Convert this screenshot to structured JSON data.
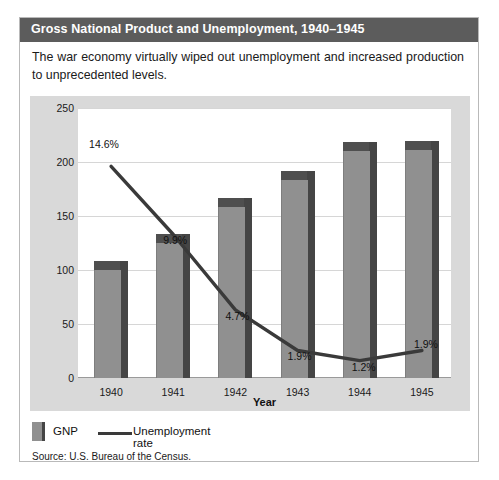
{
  "figure": {
    "title": "Gross National Product and Unemployment, 1940–1945",
    "caption": "The war economy virtually wiped out unemployment and increased production to unprecedented levels.",
    "source": "Source: U.S. Bureau of the Census."
  },
  "legend": {
    "gnp_label": "GNP",
    "unemployment_label": "Unemployment rate"
  },
  "colors": {
    "title_bar": "#5c5c5c",
    "panel_bg": "#d9d9d9",
    "plot_bg": "#ffffff",
    "bar_face": "#909090",
    "bar_shadow": "#454545",
    "line": "#3a3a3a",
    "grid": "#d6d6d6"
  },
  "chart_data": {
    "type": "bar",
    "title": "Gross National Product and Unemployment, 1940–1945",
    "xlabel": "Year",
    "ylabel": "GNP (in billions of dollars)",
    "categories": [
      "1940",
      "1941",
      "1942",
      "1943",
      "1944",
      "1945"
    ],
    "ylim": [
      0,
      250
    ],
    "yticks": [
      250,
      200,
      150,
      100,
      50,
      0
    ],
    "grid": true,
    "legend_position": "below-left",
    "series": [
      {
        "name": "GNP",
        "type": "bar",
        "unit": "billions of dollars",
        "values": [
          100,
          125,
          158,
          183,
          210,
          211
        ]
      },
      {
        "name": "Unemployment rate",
        "type": "line",
        "unit": "percent",
        "values": [
          14.6,
          9.9,
          4.7,
          1.9,
          1.2,
          1.9
        ],
        "labels": [
          "14.6%",
          "9.9%",
          "4.7%",
          "1.9%",
          "1.2%",
          "1.9%"
        ]
      }
    ]
  }
}
